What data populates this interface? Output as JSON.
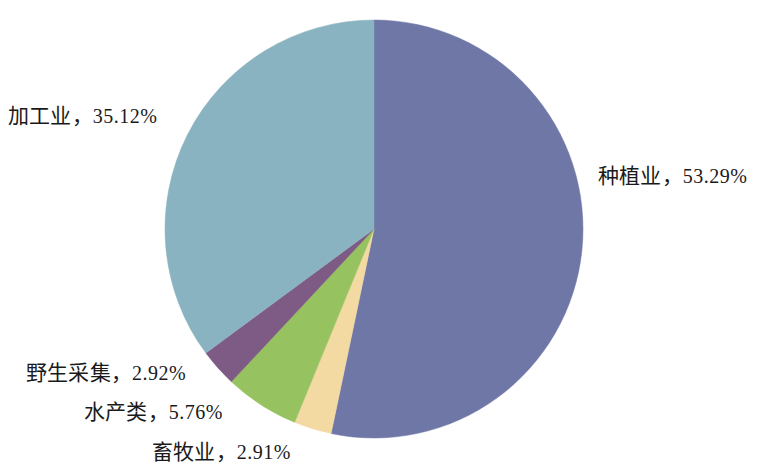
{
  "chart_data": {
    "type": "pie",
    "title": "",
    "subtitle": "",
    "xlabel": "",
    "ylabel": "",
    "legend_position": "none",
    "grid": false,
    "label_format": "name, value%",
    "separator": "，",
    "percent_sign": "%",
    "start_angle_deg": 0,
    "direction": "clockwise",
    "categories": [
      "种植业",
      "加工业",
      "水产类",
      "野生采集",
      "畜牧业"
    ],
    "values": [
      53.29,
      35.12,
      5.76,
      2.92,
      2.91
    ],
    "colors": [
      "#6f77a6",
      "#8ab3c1",
      "#97c260",
      "#7d5b84",
      "#f3d9a2"
    ],
    "slices": [
      {
        "index": 0,
        "name": "种植业",
        "value": 53.29,
        "value_text": "53.29",
        "label": "种植业，53.29%",
        "color": "#6f77a6",
        "start_deg": 0,
        "end_deg": 191.844,
        "label_position": "right"
      },
      {
        "index": 1,
        "name": "畜牧业",
        "value": 2.91,
        "value_text": "2.91",
        "label": "畜牧业，2.91%",
        "color": "#f3d9a2",
        "start_deg": 191.844,
        "end_deg": 202.32,
        "label_position": "bottom-left"
      },
      {
        "index": 2,
        "name": "水产类",
        "value": 5.76,
        "value_text": "5.76",
        "label": "水产类，5.76%",
        "color": "#97c260",
        "start_deg": 202.32,
        "end_deg": 223.056,
        "label_position": "bottom-left"
      },
      {
        "index": 3,
        "name": "野生采集",
        "value": 2.92,
        "value_text": "2.92",
        "label": "野生采集，2.92%",
        "color": "#7d5b84",
        "start_deg": 223.056,
        "end_deg": 233.568,
        "label_position": "bottom-left"
      },
      {
        "index": 4,
        "name": "加工业",
        "value": 35.12,
        "value_text": "35.12",
        "label": "加工业，35.12%",
        "color": "#8ab3c1",
        "start_deg": 233.568,
        "end_deg": 360,
        "label_position": "left"
      }
    ],
    "geometry": {
      "center_x": 374,
      "center_y": 229,
      "radius": 209
    },
    "background_color": "#ffffff",
    "text_color": "#1a1a1a"
  },
  "labels": {
    "zhongzhiye": {
      "name": "种植业",
      "sep": "，",
      "value": "53.29%"
    },
    "jiagongye": {
      "name": "加工业",
      "sep": "，",
      "value": "35.12%"
    },
    "yesheng": {
      "name": "野生采集",
      "sep": "，",
      "value": "2.92%"
    },
    "shuichan": {
      "name": "水产类",
      "sep": "，",
      "value": "5.76%"
    },
    "xumuye": {
      "name": "畜牧业",
      "sep": "，",
      "value": "2.91%"
    }
  }
}
